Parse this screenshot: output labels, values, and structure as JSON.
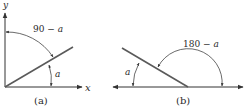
{
  "panels": [
    {
      "id": "a",
      "caption": "(a)",
      "axes": {
        "x_label": "x",
        "y_label": "y"
      },
      "angles": [
        {
          "label": "90 − a",
          "prefix": "90 − ",
          "var": "a",
          "between": "y-axis and line"
        },
        {
          "label": "a",
          "var": "a",
          "between": "x-axis and line"
        }
      ]
    },
    {
      "id": "b",
      "caption": "(b)",
      "angles": [
        {
          "label": "180 − a",
          "prefix": "180 − ",
          "var": "a",
          "between": "right horizontal and line"
        },
        {
          "label": "a",
          "var": "a",
          "between": "left horizontal and line"
        }
      ]
    }
  ],
  "colors": {
    "line": "#444444",
    "diagonal": "#5a5a5a",
    "text": "#2a2a2a"
  }
}
